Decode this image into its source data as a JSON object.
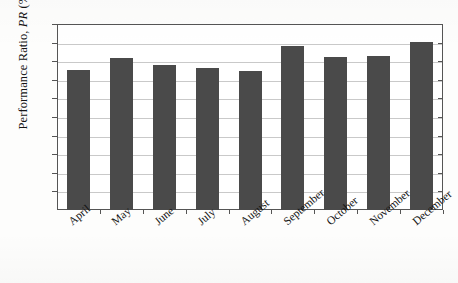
{
  "chart_data": {
    "type": "bar",
    "title": "",
    "xlabel": "",
    "ylabel": "Performance Ratio, PR (%)",
    "ylabel_plain": "Performance Ratio, ",
    "ylabel_italic": "PR",
    "ylabel_suffix": " (%)",
    "categories": [
      "April",
      "May",
      "June",
      "July",
      "August",
      "September",
      "October",
      "November",
      "December"
    ],
    "values": [
      75.5,
      81.5,
      78,
      76.5,
      75,
      88,
      82.5,
      83,
      90.5
    ],
    "series": [
      {
        "name": "Performance Ratio",
        "values": [
          75.5,
          81.5,
          78,
          76.5,
          75,
          88,
          82.5,
          83,
          90.5
        ]
      }
    ],
    "ylim": [
      0,
      100
    ],
    "ytick_values": [
      10,
      20,
      30,
      40,
      50,
      60,
      70,
      80,
      90,
      100
    ],
    "ytick_labels": [
      "10",
      "20",
      "30",
      "40",
      "50",
      "60",
      "70",
      "80",
      "90",
      "100"
    ],
    "grid": true,
    "grid_axis": "y",
    "legend": false,
    "legend_position": "none",
    "bar_color": "#4a4a4a",
    "gridline_color": "#c9c9c9",
    "axis_color": "#555555",
    "plot_background": "#ffffff",
    "figure_background": "#fdfdfc"
  }
}
